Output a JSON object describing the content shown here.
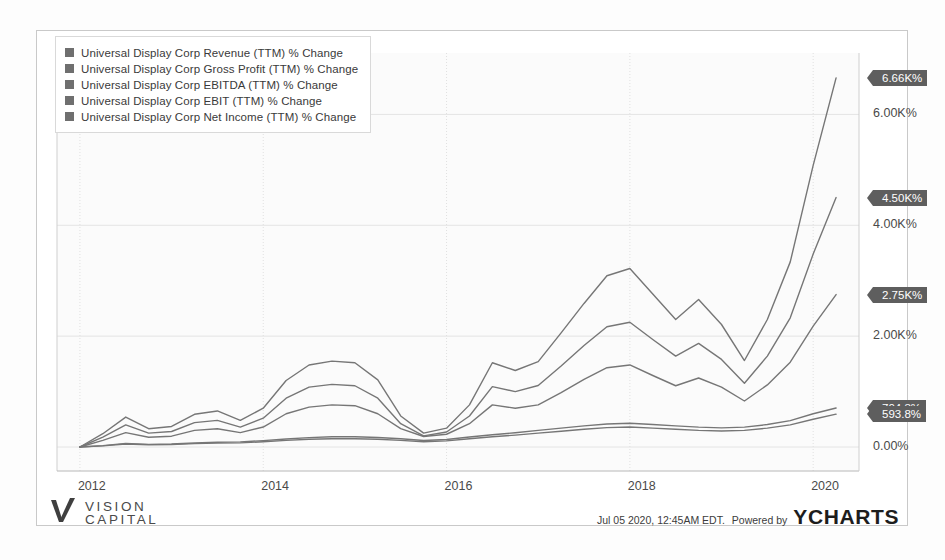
{
  "meta": {
    "provider_name": "YCHARTS",
    "powered_by_label": "Powered by",
    "timestamp": "Jul 05 2020, 12:45AM EDT.",
    "brand_line1": "VISION",
    "brand_line2": "CAPITAL",
    "line_color": "#6f6f6f",
    "flag_color": "#5e5e5e",
    "grid_color": "#e4e4e4",
    "axis_text_color": "#4a4a4a"
  },
  "chart_data": {
    "type": "line",
    "title": "",
    "xlabel": "",
    "ylabel": "",
    "grid": true,
    "legend_position": "top-left",
    "xlim": [
      2011.75,
      2020.5
    ],
    "ylim": [
      -300,
      7000
    ],
    "x_ticks": [
      "2012",
      "2014",
      "2016",
      "2018",
      "2020"
    ],
    "x_tick_values": [
      2012,
      2014,
      2016,
      2018,
      2020
    ],
    "y_ticks": [
      "6.00K%",
      "4.00K%",
      "2.00K%",
      "0.00%"
    ],
    "y_tick_values": [
      6000,
      4000,
      2000,
      0
    ],
    "end_labels": [
      {
        "text": "6.66K%",
        "value": 6660,
        "series": "Net Income"
      },
      {
        "text": "4.50K%",
        "value": 4500,
        "series": "EBIT"
      },
      {
        "text": "2.75K%",
        "value": 2750,
        "series": "EBITDA"
      },
      {
        "text": "704.3%",
        "value": 704.3,
        "series": "Gross Profit"
      },
      {
        "text": "593.8%",
        "value": 593.8,
        "series": "Revenue"
      }
    ],
    "x": [
      2012.0,
      2012.25,
      2012.5,
      2012.75,
      2013.0,
      2013.25,
      2013.5,
      2013.75,
      2014.0,
      2014.25,
      2014.5,
      2014.75,
      2015.0,
      2015.25,
      2015.5,
      2015.75,
      2016.0,
      2016.25,
      2016.5,
      2016.75,
      2017.0,
      2017.25,
      2017.5,
      2017.75,
      2018.0,
      2018.25,
      2018.5,
      2018.75,
      2019.0,
      2019.25,
      2019.5,
      2019.75,
      2020.0,
      2020.25
    ],
    "series": [
      {
        "name": "Universal Display Corp Revenue (TTM) % Change",
        "color": "#767676",
        "values": [
          0,
          20,
          55,
          40,
          45,
          60,
          70,
          75,
          95,
          120,
          140,
          150,
          150,
          140,
          120,
          95,
          110,
          150,
          185,
          215,
          250,
          285,
          320,
          350,
          360,
          340,
          320,
          300,
          290,
          300,
          340,
          400,
          500,
          593.8
        ]
      },
      {
        "name": "Universal Display Corp Gross Profit (TTM) % Change",
        "color": "#767676",
        "values": [
          0,
          25,
          65,
          48,
          55,
          72,
          85,
          92,
          115,
          145,
          170,
          185,
          185,
          172,
          148,
          118,
          135,
          180,
          220,
          258,
          300,
          340,
          382,
          415,
          428,
          405,
          382,
          358,
          345,
          358,
          405,
          475,
          600,
          704.3
        ]
      },
      {
        "name": "Universal Display Corp EBITDA (TTM) % Change",
        "color": "#767676",
        "values": [
          0,
          120,
          260,
          175,
          195,
          300,
          330,
          260,
          360,
          600,
          720,
          760,
          745,
          600,
          330,
          190,
          230,
          420,
          760,
          700,
          760,
          980,
          1220,
          1430,
          1480,
          1290,
          1105,
          1245,
          1080,
          830,
          1120,
          1530,
          2180,
          2750
        ]
      },
      {
        "name": "Universal Display Corp EBIT (TTM) % Change",
        "color": "#767676",
        "values": [
          0,
          180,
          400,
          250,
          280,
          440,
          480,
          360,
          520,
          880,
          1080,
          1130,
          1105,
          880,
          420,
          200,
          270,
          560,
          1090,
          1000,
          1110,
          1460,
          1830,
          2170,
          2250,
          1940,
          1640,
          1870,
          1580,
          1150,
          1640,
          2330,
          3480,
          4500
        ]
      },
      {
        "name": "Universal Display Corp Net Income (TTM) % Change",
        "color": "#767676",
        "values": [
          0,
          240,
          540,
          330,
          370,
          590,
          650,
          480,
          700,
          1200,
          1480,
          1550,
          1520,
          1210,
          560,
          250,
          340,
          760,
          1520,
          1380,
          1540,
          2060,
          2590,
          3090,
          3220,
          2760,
          2300,
          2660,
          2210,
          1560,
          2300,
          3340,
          5080,
          6660
        ]
      }
    ]
  },
  "legend": {
    "items": [
      {
        "label": "Universal Display Corp Revenue (TTM) % Change"
      },
      {
        "label": "Universal Display Corp Gross Profit (TTM) % Change"
      },
      {
        "label": "Universal Display Corp EBITDA (TTM) % Change"
      },
      {
        "label": "Universal Display Corp EBIT (TTM) % Change"
      },
      {
        "label": "Universal Display Corp Net Income (TTM) % Change"
      }
    ]
  }
}
